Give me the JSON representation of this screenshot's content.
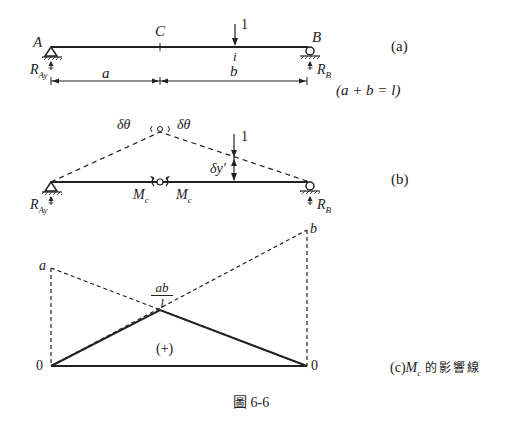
{
  "figure": {
    "caption": "圖 6-6",
    "line_color": "#222222",
    "background": "#ffffff"
  },
  "panel_a": {
    "tag": "(a)",
    "support_left": "A",
    "support_right": "B",
    "point_c": "C",
    "load_point": "i",
    "load_value": "1",
    "reaction_left": "R",
    "reaction_left_sub": "Ay",
    "reaction_right": "R",
    "reaction_right_sub": "B",
    "dim_a": "a",
    "dim_b": "b",
    "relation": "(a + b = l)"
  },
  "panel_b": {
    "tag": "(b)",
    "rotation_left": "δθ",
    "rotation_right": "δθ",
    "load_value": "1",
    "deflection": "δy′",
    "moment_left": "M",
    "moment_left_sub": "c",
    "moment_right": "M",
    "moment_right_sub": "c",
    "reaction_left": "R",
    "reaction_left_sub": "Ay",
    "reaction_right": "R",
    "reaction_right_sub": "B"
  },
  "panel_c": {
    "tag_prefix": "(c)",
    "tag_symbol": "M",
    "tag_symbol_sub": "c",
    "tag_suffix": "的影響線",
    "left_ordinate": "a",
    "right_ordinate": "b",
    "peak_numerator": "ab",
    "peak_denominator": "l",
    "sign": "(+)",
    "left_zero": "0",
    "right_zero": "0"
  }
}
